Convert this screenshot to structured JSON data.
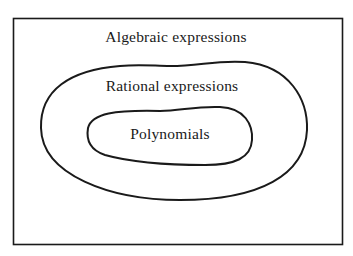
{
  "diagram": {
    "type": "nested-set-diagram",
    "sets": [
      {
        "label": "Algebraic expressions",
        "level": 0
      },
      {
        "label": "Rational expressions",
        "level": 1
      },
      {
        "label": "Polynomials",
        "level": 2
      }
    ],
    "stroke_color": "#1a1a1a",
    "background": "#ffffff"
  }
}
